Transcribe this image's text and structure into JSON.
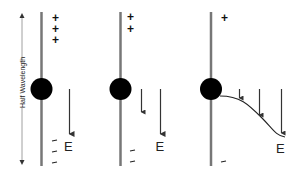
{
  "diagram": {
    "dimension_label": "Half Wavelength",
    "field_label": "E",
    "colors": {
      "antenna": "#777777",
      "charge": "#000000",
      "arrow": "#333333",
      "text": "#111111"
    },
    "panels": [
      {
        "id": "panel-1",
        "top_charges": [
          "+",
          "+",
          "+"
        ],
        "bottom_charges": [
          "–",
          "–",
          "–"
        ],
        "field_arrows": 1,
        "field_label": "E"
      },
      {
        "id": "panel-2",
        "top_charges": [
          "+",
          "+"
        ],
        "bottom_charges": [
          "–",
          "–"
        ],
        "field_arrows": 2,
        "field_label": "E"
      },
      {
        "id": "panel-3",
        "top_charges": [
          "+"
        ],
        "bottom_charges": [
          "–"
        ],
        "field_arrows": 3,
        "field_label": "E",
        "curve": true
      }
    ]
  }
}
